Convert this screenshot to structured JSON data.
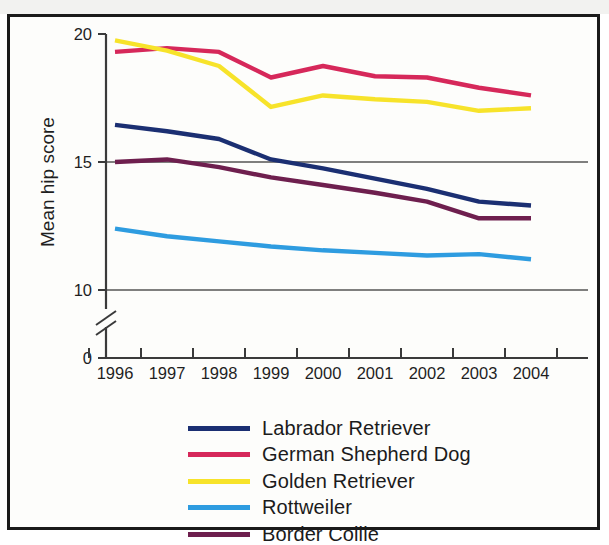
{
  "chart_data": {
    "type": "line",
    "title": "",
    "xlabel": "",
    "ylabel": "Mean hip score",
    "x": [
      "1996",
      "1997",
      "1998",
      "1999",
      "2000",
      "2001",
      "2002",
      "2003",
      "2004"
    ],
    "categories": [
      "1996",
      "1997",
      "1998",
      "1999",
      "2000",
      "2001",
      "2002",
      "2003",
      "2004"
    ],
    "ylim": [
      10,
      20
    ],
    "y_ticks": [
      "0",
      "10",
      "15",
      "20"
    ],
    "y_tick_values": [
      0,
      10,
      15,
      20
    ],
    "axis_break": true,
    "axis_break_note": "y-axis broken between 0 and 10",
    "grid": "horizontal gridlines at 10 and 15",
    "legend_position": "below plot, centered",
    "series": [
      {
        "name": "Labrador Retriever",
        "color": "#1b2f72",
        "values": [
          16.45,
          16.2,
          15.9,
          15.1,
          14.75,
          14.35,
          13.95,
          13.45,
          13.3
        ]
      },
      {
        "name": "German Shepherd Dog",
        "color": "#d6285a",
        "values": [
          19.3,
          19.45,
          19.3,
          18.3,
          18.75,
          18.35,
          18.3,
          17.9,
          17.6
        ]
      },
      {
        "name": "Golden Retriever",
        "color": "#f7e32a",
        "values": [
          19.75,
          19.35,
          18.75,
          17.15,
          17.6,
          17.45,
          17.35,
          17.0,
          17.1
        ]
      },
      {
        "name": "Rottweiler",
        "color": "#2e9ce0",
        "values": [
          12.4,
          12.1,
          11.9,
          11.7,
          11.55,
          11.45,
          11.35,
          11.4,
          11.2
        ]
      },
      {
        "name": "Border Collie",
        "color": "#6e1f4e",
        "values": [
          15.0,
          15.1,
          14.8,
          14.4,
          14.1,
          13.8,
          13.45,
          12.8,
          12.8
        ]
      }
    ]
  },
  "legend": {
    "items": [
      {
        "label": "Labrador Retriever",
        "color": "#1b2f72"
      },
      {
        "label": "German Shepherd Dog",
        "color": "#d6285a"
      },
      {
        "label": "Golden Retriever",
        "color": "#f7e32a"
      },
      {
        "label": "Rottweiler",
        "color": "#2e9ce0"
      },
      {
        "label": "Border Collie",
        "color": "#6e1f4e"
      }
    ]
  },
  "axes": {
    "y_title": "Mean hip score",
    "y_labels": [
      "20",
      "15",
      "10",
      "0"
    ],
    "x_labels": [
      "1996",
      "1997",
      "1998",
      "1999",
      "2000",
      "2001",
      "2002",
      "2003",
      "2004"
    ]
  }
}
